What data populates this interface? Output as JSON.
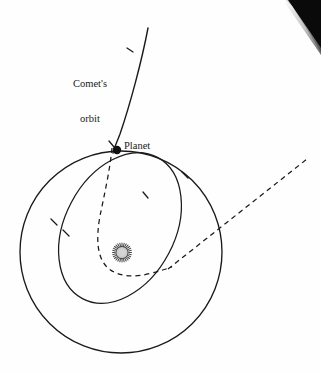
{
  "figure": {
    "background_color": "#fefefe",
    "stroke_color": "#1a1a1a",
    "width": 321,
    "height": 373
  },
  "labels": {
    "comet_orbit_line1": "Comet's",
    "comet_orbit_line2": "orbit",
    "planet": "Planet"
  },
  "markers": {
    "planet_dot": {
      "name": "planet-dot",
      "cx": 117,
      "cy": 150,
      "r": 4.2,
      "color": "#111111"
    },
    "sun": {
      "name": "sun-symbol",
      "cx": 122,
      "cy": 252,
      "core_radius": 6.0,
      "spike_outer_radius": 8.6,
      "spike_count": 26,
      "fill_color": "#cccccc",
      "stroke_color": "#4a4a4a"
    }
  },
  "curves": {
    "planet_orbit_circle": {
      "name": "planet-orbit",
      "style": "solid",
      "cx": 121,
      "cy": 252,
      "r": 101
    },
    "comet_inner_ellipse": {
      "name": "comet-inner-ellipse",
      "style": "solid",
      "cx": 120,
      "cy": 228,
      "rx": 55,
      "ry": 80,
      "rotation_deg": 28
    },
    "comet_incoming_path": {
      "name": "comet-incoming-path",
      "style": "solid",
      "from": [
        148,
        28
      ],
      "to": [
        113,
        152
      ]
    },
    "comet_deflected_path": {
      "name": "comet-deflected-path",
      "style": "dashed",
      "dash_pattern": "5,4"
    },
    "comet_outgoing_asymptote": {
      "name": "comet-outgoing-asymptote",
      "style": "dashed",
      "from": [
        170,
        268
      ],
      "to": [
        307,
        159
      ],
      "dash_pattern": "5,4"
    }
  },
  "direction_ticks": [
    {
      "name": "tick-comet-incoming",
      "x": 130,
      "y": 50,
      "angle_deg": 108
    },
    {
      "name": "tick-comet-near-planet",
      "x": 112,
      "y": 144,
      "angle_deg": 100
    },
    {
      "name": "tick-planet-orbit-upper-right",
      "x": 185,
      "y": 175,
      "angle_deg": 38
    },
    {
      "name": "tick-planet-orbit-left",
      "x": 54,
      "y": 222,
      "angle_deg": 118
    },
    {
      "name": "tick-inner-ellipse-right",
      "x": 146,
      "y": 195,
      "angle_deg": 72
    },
    {
      "name": "tick-inner-ellipse-left",
      "x": 66,
      "y": 233,
      "angle_deg": 104
    }
  ],
  "artifacts": {
    "scan_corner": {
      "name": "scan-corner-artifact",
      "color": "#0a0a0a",
      "description": "black triangular page-scan shadow at top right"
    }
  }
}
